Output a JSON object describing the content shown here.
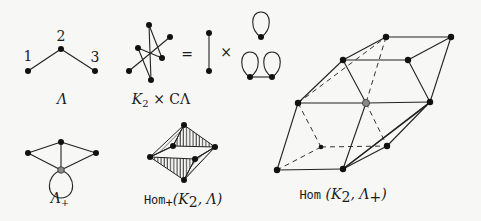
{
  "figure": {
    "lambda": {
      "node_labels": [
        "1",
        "2",
        "3"
      ],
      "caption": "Λ"
    },
    "product": {
      "caption_k": "K",
      "caption_sub": "2",
      "caption_rest": " × CΛ",
      "equals": "=",
      "times": "×"
    },
    "lambda_plus": {
      "caption": "Λ",
      "caption_sub": "+"
    },
    "hom_plus": {
      "caption_hom": "Hom",
      "caption_sub": "+",
      "caption_args": "(K",
      "caption_args_sub": "2",
      "caption_args_end": ", Λ)"
    },
    "hom": {
      "caption_hom": "Hom",
      "caption_args": " (K",
      "caption_args_sub": "2",
      "caption_args_mid": ", Λ",
      "caption_args_sup": "+",
      "caption_args_end": ")"
    },
    "colors": {
      "node": "#111111",
      "special_node": "#8a8a8a",
      "background": "#f7f7f5"
    }
  }
}
